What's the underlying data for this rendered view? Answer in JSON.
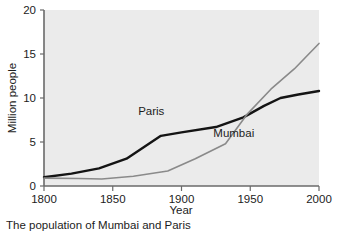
{
  "caption": "The population of Mumbai and Paris",
  "chart_data": {
    "type": "line",
    "title": "",
    "xlabel": "Year",
    "ylabel": "Million people",
    "xlim": [
      1800,
      2000
    ],
    "ylim": [
      0,
      20
    ],
    "xticks": [
      1800,
      1850,
      1900,
      1950,
      2000
    ],
    "yticks": [
      0,
      5,
      10,
      15,
      20
    ],
    "xtick_labels": [
      "1800",
      "1850",
      "1900",
      "1950",
      "2000"
    ],
    "ytick_labels": [
      "0",
      "5",
      "10",
      "15",
      "20"
    ],
    "grid": false,
    "legend": "inline-labels",
    "plot_background": "#ebebeb",
    "series": [
      {
        "name": "Paris",
        "color": "#141414",
        "width": 2.4,
        "label_x": 1878,
        "label_y": 8.1,
        "x": [
          1800,
          1820,
          1840,
          1860,
          1885,
          1900,
          1925,
          1945,
          1960,
          1972,
          1985,
          2000
        ],
        "values": [
          1.0,
          1.4,
          2.0,
          3.1,
          5.7,
          6.1,
          6.7,
          7.8,
          9.1,
          10.0,
          10.4,
          10.8
        ]
      },
      {
        "name": "Mumbai",
        "color": "#8a8a8a",
        "width": 1.6,
        "label_x": 1938,
        "label_y": 5.6,
        "x": [
          1800,
          1825,
          1842,
          1865,
          1890,
          1910,
          1932,
          1948,
          1965,
          1982,
          2000
        ],
        "values": [
          0.9,
          0.85,
          0.8,
          1.1,
          1.7,
          3.1,
          4.8,
          8.2,
          11.0,
          13.3,
          16.2
        ]
      }
    ]
  },
  "axes": {
    "year_label": "Year",
    "population_label": "Million people"
  }
}
